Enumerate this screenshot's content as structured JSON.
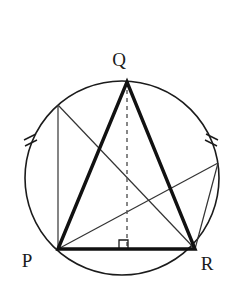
{
  "figure": {
    "background_color": "#ffffff",
    "stroke_color": "#1b1b1b",
    "bold_stroke_color": "#111111",
    "thin_stroke_color": "#333333",
    "dashed_stroke_color": "#555555",
    "labels": {
      "p": "P",
      "q": "Q",
      "r": "R"
    },
    "label_positions": {
      "p": {
        "x": 27,
        "y": 267
      },
      "q": {
        "x": 119,
        "y": 66
      },
      "r": {
        "x": 207,
        "y": 270
      }
    },
    "circle": {
      "cx": 122,
      "cy": 178,
      "r": 97,
      "stroke_width": 1.6
    },
    "points": {
      "P": {
        "x": 58,
        "y": 249
      },
      "Q": {
        "x": 127,
        "y": 82
      },
      "R": {
        "x": 195,
        "y": 249
      },
      "foot": {
        "x": 127,
        "y": 249
      },
      "upper_left": {
        "x": 58,
        "y": 105
      },
      "right": {
        "x": 218,
        "y": 163
      }
    },
    "triangle": {
      "name": "triangle-pqr",
      "stroke_width": 3.4,
      "vertices": "58,249 127,82 195,249"
    },
    "altitude": {
      "name": "altitude-q-to-pr",
      "from": {
        "x": 127,
        "y": 82
      },
      "to": {
        "x": 127,
        "y": 249
      },
      "dash": "4,4",
      "stroke_width": 1.4
    },
    "right_angle_marker": {
      "name": "right-angle-marker",
      "points": "119,249 119,240 128,240 128,249",
      "size": 9
    },
    "thin_chords": [
      {
        "name": "chord-upperleft-to-p",
        "x1": 58,
        "y1": 105,
        "x2": 58,
        "y2": 249
      },
      {
        "name": "chord-upperleft-to-r",
        "x1": 58,
        "y1": 105,
        "x2": 195,
        "y2": 249
      },
      {
        "name": "chord-p-to-right",
        "x1": 58,
        "y1": 249,
        "x2": 218,
        "y2": 163
      },
      {
        "name": "chord-right-to-r",
        "x1": 218,
        "y1": 163,
        "x2": 195,
        "y2": 249
      }
    ],
    "tick_marks": {
      "count_per_side": 2,
      "left": [
        {
          "x1": 24,
          "y1": 140,
          "x2": 36,
          "y2": 134
        },
        {
          "x1": 25,
          "y1": 146,
          "x2": 37,
          "y2": 140
        }
      ],
      "right": [
        {
          "x1": 206,
          "y1": 134,
          "x2": 218,
          "y2": 140
        },
        {
          "x1": 205,
          "y1": 140,
          "x2": 217,
          "y2": 146
        }
      ]
    }
  }
}
